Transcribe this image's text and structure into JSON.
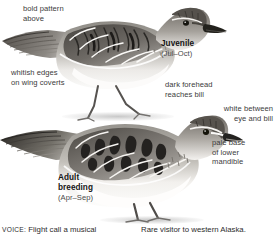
{
  "page": {
    "background": "#ffffff",
    "text_color": "#3b3b3b",
    "heading_color": "#141414",
    "width": 277,
    "height": 237
  },
  "annotations": {
    "bold_pattern": "bold pattern\nabove",
    "whitish_edges": "whitish edges\non wing coverts",
    "dark_forehead": "dark forehead\nreaches bill",
    "white_between": "white between\neye and bill",
    "pale_base": "pale base\nof lower\nmandible"
  },
  "captions": {
    "juvenile": {
      "name": "Juvenile",
      "season": "(Jul–Oct)"
    },
    "adult_breeding": {
      "name": "Adult\nbreeding",
      "season": "(Apr–Sep)"
    }
  },
  "footer": {
    "voice_label": "VOICE:",
    "voice_text": " Flight call a musical",
    "range_text": "Rare visitor to western Alaska."
  },
  "illustrations": {
    "juvenile_bird": "sandpiper-standing-facing-right-juvenile",
    "adult_bird": "sandpiper-standing-facing-right-adult-breeding"
  }
}
